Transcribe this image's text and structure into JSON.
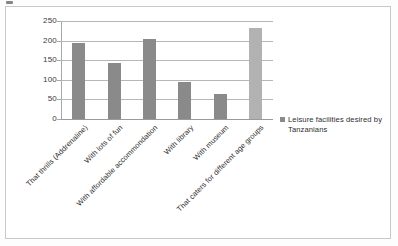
{
  "chart_data": {
    "type": "bar",
    "title": "",
    "subtitle": "",
    "xlabel": "",
    "ylabel": "",
    "ylim": [
      0,
      250
    ],
    "yticks": [
      0,
      50,
      100,
      150,
      200,
      250
    ],
    "grid": true,
    "legend_position": "right",
    "categories": [
      "That thrills (Addrenaline)",
      "With lots of fun",
      "With affordable accommondation",
      "With library",
      "With museum",
      "That caters for different age groups"
    ],
    "series": [
      {
        "name": "Leisure facilities desired by Tanzanians",
        "values": [
          193,
          143,
          203,
          95,
          65,
          232
        ],
        "colors": [
          "#8a8a8a",
          "#8a8a8a",
          "#8a8a8a",
          "#8a8a8a",
          "#8a8a8a",
          "#b2b2b2"
        ]
      }
    ]
  },
  "axis": {
    "y_tick_labels": [
      "0",
      "50",
      "100",
      "150",
      "200",
      "250"
    ]
  },
  "legend": {
    "entries": [
      {
        "label": "Leisure facilities desired by Tanzanians",
        "swatch_color": "#8a8a8a"
      }
    ]
  },
  "colors": {
    "bar_primary": "#8a8a8a",
    "bar_highlight": "#b2b2b2",
    "gridline": "#b7b7b7",
    "frame_border": "#c9c9c9",
    "text": "#2e2e2e"
  }
}
